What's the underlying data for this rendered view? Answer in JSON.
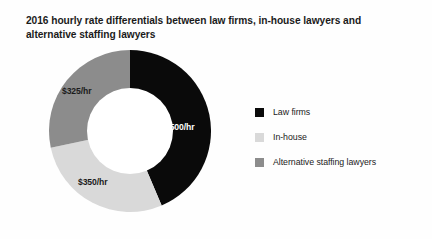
{
  "chart_data": {
    "type": "pie",
    "variant": "donut",
    "title": "2016 hourly rate differentials between law firms, in-house lawyers and alternative staffing lawyers",
    "title_line1": "2016 hourly rate differentials between law firms, in-house lawyers",
    "title_line2": "and alternative staffing lawyers",
    "xlabel": "",
    "ylabel": "",
    "unit": "$/hr",
    "grid": false,
    "legend_position": "right",
    "inner_radius_ratio": 0.53,
    "start_angle_deg": 0,
    "categories": [
      "Law firms",
      "In-house",
      "Alternative staffing lawyers"
    ],
    "values": [
      500,
      350,
      325
    ],
    "data_labels": [
      "$500/hr",
      "$350/hr",
      "$325/hr"
    ],
    "colors": [
      "#0a0a0a",
      "#d9d9d9",
      "#8c8c8c"
    ],
    "slices": [
      {
        "name": "Law firms",
        "value": 500,
        "data_label": "$500/hr",
        "color": "#0a0a0a",
        "label_color": "#ffffff",
        "start_angle_deg": 0,
        "end_angle_deg": 157,
        "share_pct": 43.6
      },
      {
        "name": "In-house",
        "value": 350,
        "data_label": "$350/hr",
        "color": "#d9d9d9",
        "label_color": "#1b1b1b",
        "start_angle_deg": 157,
        "end_angle_deg": 258,
        "share_pct": 28.1
      },
      {
        "name": "Alternative staffing lawyers",
        "value": 325,
        "data_label": "$325/hr",
        "color": "#8c8c8c",
        "label_color": "#1b1b1b",
        "start_angle_deg": 258,
        "end_angle_deg": 360,
        "share_pct": 28.3
      }
    ]
  },
  "legend": {
    "items": [
      {
        "label": "Law firms",
        "color": "#0a0a0a"
      },
      {
        "label": "In-house",
        "color": "#d9d9d9"
      },
      {
        "label": "Alternative staffing lawyers",
        "color": "#8c8c8c"
      }
    ]
  },
  "colors": {
    "background": "#fefefe",
    "text": "#1b1b1b",
    "hole": "#ffffff"
  }
}
